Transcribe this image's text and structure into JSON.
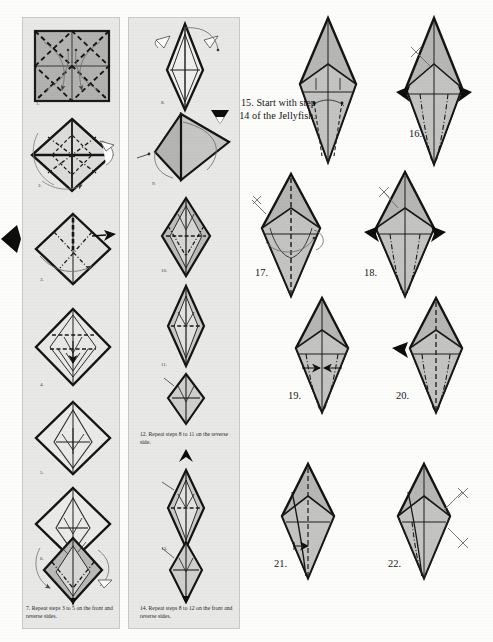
{
  "document": {
    "title": "Origami folding instructions diagram sheet",
    "page_background": "#fdfdfc",
    "panel_background": "#e8e8e6",
    "ink_color": "#1a1a1a",
    "paper_fill": "#b4b4b2",
    "paper_fill_light": "#d2d2d0"
  },
  "columns": {
    "left": {
      "name": "steps-1-to-7-column",
      "steps": [
        "1.",
        "2.",
        "3.",
        "4.",
        "5.",
        "6."
      ]
    },
    "middle": {
      "name": "steps-8-to-14-column",
      "steps": [
        "8.",
        "9.",
        "10.",
        "11.",
        "13."
      ]
    },
    "right": {
      "name": "steps-15-to-22-column"
    }
  },
  "captions": {
    "step7": "7. Repeat steps 3 to 5 on the front and reverse sides.",
    "step12": "12. Repeat steps 8 to 11 on the reverse side.",
    "step14": "14. Repeat steps 8 to 12 on the front and reverse sides.",
    "step15": "15. Start with step 14 of the Jellyfish."
  },
  "right_steps": [
    {
      "number": "16."
    },
    {
      "number": "17."
    },
    {
      "number": "18."
    },
    {
      "number": "19."
    },
    {
      "number": "20."
    },
    {
      "number": "21."
    },
    {
      "number": "22."
    }
  ],
  "icons": {
    "edge_arrow": "left-pointing-triangle-marker",
    "fold_arrow": "solid-black-arrowhead",
    "valley_fold": "dashed-line",
    "mountain_fold": "dash-dot-line",
    "turn_over": "curved-arrow"
  }
}
